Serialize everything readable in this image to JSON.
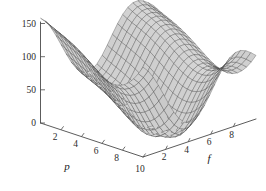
{
  "chart_data": {
    "type": "surface",
    "title": "",
    "xlabel": "p",
    "ylabel": "f",
    "zlabel": "",
    "grid": false,
    "legend": "none",
    "projection": "3d",
    "surface_color": "#d5d5d5",
    "mesh_color": "#3a3a3a",
    "axis_color": "#4a4a4a",
    "background_color": "#ffffff",
    "x_axis": {
      "name": "p",
      "ticks": [
        2,
        4,
        6,
        8,
        10
      ],
      "tick_labels": [
        "2",
        "4",
        "6",
        "8",
        "10"
      ],
      "range": [
        0,
        10
      ]
    },
    "y_axis": {
      "name": "f",
      "ticks": [
        2,
        4,
        6,
        8
      ],
      "tick_labels": [
        "2",
        "4",
        "6",
        "8"
      ],
      "range": [
        0,
        10
      ]
    },
    "z_axis": {
      "name": "",
      "ticks": [
        0,
        50,
        100,
        150
      ],
      "tick_labels": [
        "0",
        "50",
        "100",
        "150"
      ],
      "range": [
        0,
        160
      ]
    },
    "surface_function": "z = 2.1*(p-5.2)^2 + 1.35*(f-5.2)^2 + 36*cos(0.78*f) + 22*sin(0.55*p) + 30",
    "z_min": 0,
    "z_max": 155
  },
  "axis_labels": {
    "x_name": "p",
    "y_name": "f",
    "z_ticks": [
      "150",
      "100",
      "50",
      "0"
    ],
    "x_ticks": [
      "2",
      "4",
      "6",
      "8",
      "10"
    ],
    "y_ticks": [
      "2",
      "4",
      "6",
      "8"
    ]
  }
}
